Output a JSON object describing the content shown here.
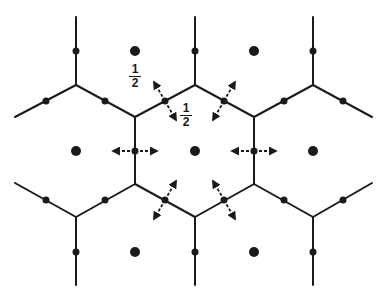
{
  "diagram": {
    "colors": {
      "line": "#1a1a1a",
      "background": "#ffffff"
    },
    "labels": [
      {
        "id": "half-label-1",
        "numerator": "1",
        "denominator": "2",
        "x": 129,
        "y": 64
      },
      {
        "id": "half-label-2",
        "numerator": "1",
        "denominator": "2",
        "x": 180,
        "y": 103
      }
    ],
    "lattice_points": [
      [
        135,
        51
      ],
      [
        254,
        51
      ],
      [
        76,
        151
      ],
      [
        195,
        151
      ],
      [
        313,
        151
      ],
      [
        135,
        252
      ],
      [
        254,
        252
      ]
    ],
    "edge_points": [
      [
        76,
        51
      ],
      [
        195,
        51
      ],
      [
        313,
        51
      ],
      [
        46,
        101
      ],
      [
        105,
        101
      ],
      [
        165,
        101
      ],
      [
        224,
        101
      ],
      [
        284,
        101
      ],
      [
        343,
        101
      ],
      [
        135,
        151
      ],
      [
        254,
        151
      ],
      [
        46,
        200
      ],
      [
        105,
        200
      ],
      [
        165,
        200
      ],
      [
        224,
        200
      ],
      [
        284,
        200
      ],
      [
        343,
        200
      ],
      [
        76,
        252
      ],
      [
        195,
        252
      ],
      [
        313,
        252
      ]
    ],
    "segments": [
      [
        76,
        17,
        76,
        85
      ],
      [
        195,
        17,
        195,
        85
      ],
      [
        313,
        17,
        313,
        85
      ],
      [
        15,
        117,
        76,
        85
      ],
      [
        76,
        85,
        135,
        117
      ],
      [
        135,
        117,
        195,
        85
      ],
      [
        195,
        85,
        254,
        117
      ],
      [
        254,
        117,
        313,
        85
      ],
      [
        313,
        85,
        372,
        117
      ],
      [
        135,
        117,
        135,
        184
      ],
      [
        254,
        117,
        254,
        184
      ],
      [
        15,
        183,
        76,
        217
      ],
      [
        76,
        217,
        135,
        184
      ],
      [
        135,
        184,
        195,
        217
      ],
      [
        195,
        217,
        254,
        184
      ],
      [
        254,
        184,
        313,
        217
      ],
      [
        313,
        217,
        372,
        183
      ],
      [
        76,
        217,
        76,
        285
      ],
      [
        195,
        217,
        195,
        285
      ],
      [
        313,
        217,
        313,
        285
      ]
    ],
    "arrows": [
      {
        "at": [
          165,
          101
        ],
        "dir": [
          -0.5,
          -0.866
        ]
      },
      {
        "at": [
          165,
          101
        ],
        "dir": [
          0.5,
          0.866
        ]
      },
      {
        "at": [
          224,
          101
        ],
        "dir": [
          0.5,
          -0.866
        ]
      },
      {
        "at": [
          224,
          101
        ],
        "dir": [
          -0.5,
          0.866
        ]
      },
      {
        "at": [
          135,
          151
        ],
        "dir": [
          -1,
          0
        ]
      },
      {
        "at": [
          135,
          151
        ],
        "dir": [
          1,
          0
        ]
      },
      {
        "at": [
          254,
          151
        ],
        "dir": [
          -1,
          0
        ]
      },
      {
        "at": [
          254,
          151
        ],
        "dir": [
          1,
          0
        ]
      },
      {
        "at": [
          165,
          200
        ],
        "dir": [
          0.5,
          -0.866
        ]
      },
      {
        "at": [
          165,
          200
        ],
        "dir": [
          -0.5,
          0.866
        ]
      },
      {
        "at": [
          224,
          200
        ],
        "dir": [
          -0.5,
          -0.866
        ]
      },
      {
        "at": [
          224,
          200
        ],
        "dir": [
          0.5,
          0.866
        ]
      }
    ]
  }
}
